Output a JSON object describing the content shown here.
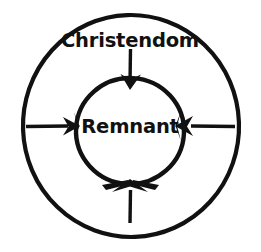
{
  "diagram": {
    "type": "concentric-circles",
    "background_color": "#ffffff",
    "stroke_color": "#111111",
    "text_color": "#111111",
    "outer_region": {
      "label": "Christendom",
      "label_x": 130,
      "label_y": 41,
      "center_x": 131,
      "center_y": 126,
      "radius": 107,
      "stroke_width": 4.2
    },
    "inner_region": {
      "label": "Remnant",
      "label_x": 130,
      "label_y": 127,
      "center_x": 130,
      "center_y": 131,
      "radius": 53,
      "stroke_width": 4.2
    },
    "arrows": [
      {
        "name": "arrow-top",
        "direction": "down",
        "description": "Christendom pressing inward from top",
        "x1": 130,
        "y1": 50,
        "x2": 130,
        "y2": 86
      },
      {
        "name": "arrow-left",
        "direction": "right",
        "description": "pressure inward from left",
        "x1": 27,
        "y1": 126,
        "x2": 79,
        "y2": 126
      },
      {
        "name": "arrow-right",
        "direction": "left",
        "description": "pressure inward from right",
        "x1": 234,
        "y1": 126,
        "x2": 176,
        "y2": 126
      },
      {
        "name": "arrow-bottom",
        "direction": "up",
        "description": "pressure inward from bottom",
        "x1": 130,
        "y1": 222,
        "x2": 130,
        "y2": 182
      }
    ]
  }
}
